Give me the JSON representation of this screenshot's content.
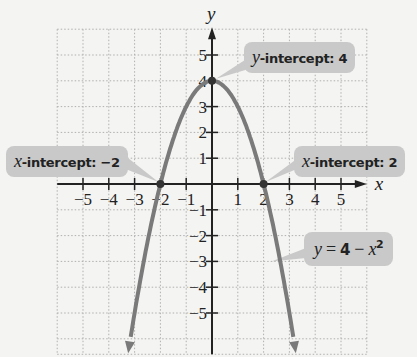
{
  "chart_data": {
    "type": "line",
    "title": "",
    "xlabel": "x",
    "ylabel": "y",
    "xlim": [
      -6,
      6
    ],
    "ylim": [
      -6.5,
      6
    ],
    "grid": true,
    "x_ticks": [
      -5,
      -4,
      -3,
      -2,
      -1,
      1,
      2,
      3,
      4,
      5
    ],
    "y_ticks": [
      -5,
      -4,
      -3,
      -2,
      -1,
      1,
      2,
      3,
      4,
      5
    ],
    "series": [
      {
        "name": "y = 4 − x²",
        "function": "4 - x^2",
        "x": [
          -3.25,
          -3,
          -2.5,
          -2,
          -1.5,
          -1,
          -0.5,
          0,
          0.5,
          1,
          1.5,
          2,
          2.5,
          3,
          3.25
        ],
        "y": [
          -6.5625,
          -5,
          -2.25,
          0,
          1.75,
          3,
          3.75,
          4,
          3.75,
          3,
          1.75,
          0,
          -2.25,
          -5,
          -6.5625
        ],
        "color": "#7a7a7a"
      }
    ],
    "points": [
      {
        "x": -2,
        "y": 0,
        "label": "x-intercept: −2"
      },
      {
        "x": 0,
        "y": 4,
        "label": "y-intercept: 4"
      },
      {
        "x": 2,
        "y": 0,
        "label": "x-intercept: 2"
      }
    ],
    "annotations": [
      {
        "text": "x-intercept: −2",
        "target": [
          -2,
          0
        ]
      },
      {
        "text": "y-intercept: 4",
        "target": [
          0,
          4
        ]
      },
      {
        "text": "x-intercept: 2",
        "target": [
          2,
          0
        ]
      },
      {
        "text": "y = 4 − x²",
        "target": [
          2.3,
          -3
        ]
      }
    ]
  },
  "labels": {
    "x_axis": "x",
    "y_axis": "y",
    "xint_left_var": "x",
    "xint_left_text": "-intercept: −2",
    "yint_var": "y",
    "yint_text": "-intercept: 4",
    "xint_right_var": "x",
    "xint_right_text": "-intercept: 2",
    "eq_y": "y",
    "eq_eq": " = ",
    "eq_four": "4",
    "eq_minus": " − ",
    "eq_x": "x",
    "eq_sup": "2"
  },
  "colors": {
    "curve": "#7a7a7a",
    "callout_bg": "#c9c9c9",
    "axis": "#222222",
    "grid": "#b0b0b0"
  }
}
